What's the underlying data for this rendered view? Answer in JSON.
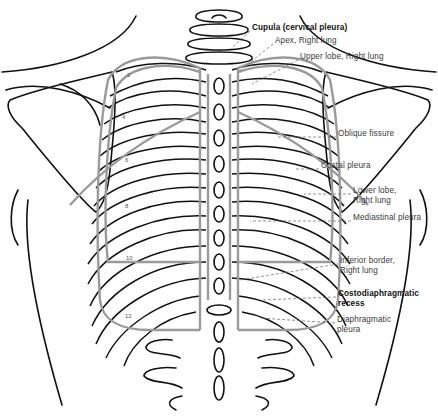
{
  "figure": {
    "colors": {
      "outline": "#111111",
      "pleura_line": "#9a9a9a",
      "leader_line": "#666666",
      "background": "#ffffff"
    }
  },
  "labels": [
    {
      "id": "cupula",
      "text": "Cupula (cervical pleura)",
      "bold": true,
      "x": 252,
      "y": 27
    },
    {
      "id": "apex",
      "text": "Apex, Right lung",
      "bold": false,
      "x": 275,
      "y": 40
    },
    {
      "id": "upper-lobe",
      "text": "Upper lobe, Right lung",
      "bold": false,
      "x": 300,
      "y": 56
    },
    {
      "id": "oblique-fissure",
      "text": "Oblique fissure",
      "bold": false,
      "x": 338,
      "y": 133
    },
    {
      "id": "costal-pleura",
      "text": "Costal pleura",
      "bold": false,
      "x": 321,
      "y": 165
    },
    {
      "id": "lower-lobe",
      "text": [
        "Lower lobe,",
        "Right lung"
      ],
      "bold": false,
      "x": 353,
      "y": 190
    },
    {
      "id": "mediastinal-pleura",
      "text": "Mediastinal pleura",
      "bold": false,
      "x": 353,
      "y": 217
    },
    {
      "id": "inferior-border",
      "text": [
        "Inferior border,",
        "Right lung"
      ],
      "bold": false,
      "x": 340,
      "y": 260
    },
    {
      "id": "costodiaphragmatic-recess",
      "text": [
        "Costodiaphragmatic",
        "recess"
      ],
      "bold": true,
      "x": 338,
      "y": 293
    },
    {
      "id": "diaphragmatic-pleura",
      "text": [
        "Diaphragmatic",
        "pleura"
      ],
      "bold": false,
      "x": 337,
      "y": 319
    }
  ],
  "rib_numbers": [
    {
      "n": "2",
      "x": 129,
      "y": 76
    },
    {
      "n": "4",
      "x": 124,
      "y": 118
    },
    {
      "n": "6",
      "x": 127,
      "y": 161
    },
    {
      "n": "8",
      "x": 127,
      "y": 207
    },
    {
      "n": "10",
      "x": 129,
      "y": 259
    },
    {
      "n": "12",
      "x": 128,
      "y": 317
    }
  ]
}
